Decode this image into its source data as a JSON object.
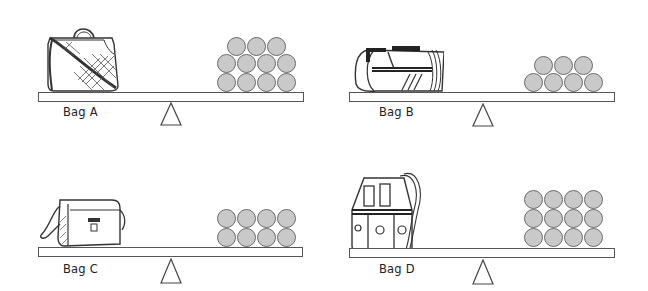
{
  "panels": [
    {
      "id": "A",
      "label": "Bag A",
      "bag_type": "quilted-handbag",
      "ball_rows": [
        3,
        4,
        4
      ],
      "ball_count": 11
    },
    {
      "id": "B",
      "label": "Bag B",
      "bag_type": "duffel-bag",
      "ball_rows": [
        3,
        4
      ],
      "ball_count": 7
    },
    {
      "id": "C",
      "label": "Bag C",
      "bag_type": "messenger-bag",
      "ball_rows": [
        4,
        4
      ],
      "ball_count": 8
    },
    {
      "id": "D",
      "label": "Bag D",
      "bag_type": "drawstring-bucket-bag",
      "ball_rows": [
        4,
        4,
        4
      ],
      "ball_count": 12
    }
  ],
  "colors": {
    "ball_fill": "#c9c9c9",
    "ball_stroke": "#6a6a6a",
    "line": "#555555",
    "background": "#ffffff"
  }
}
